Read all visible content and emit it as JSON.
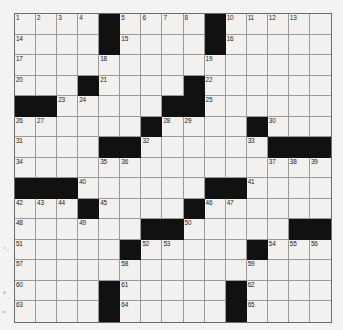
{
  "puzzle": {
    "title": "Crossword Grid",
    "rows": 15,
    "cols": 15,
    "colors": {
      "block": "#111111",
      "cell": "#f2f1ef",
      "gridline": "#9a9a9a",
      "border": "#6b6b6b",
      "page_background": "#f4f3f1",
      "number_text": "#1a1a1a"
    },
    "black_squares": [
      [
        0,
        4
      ],
      [
        0,
        9
      ],
      [
        1,
        4
      ],
      [
        1,
        9
      ],
      [
        3,
        3
      ],
      [
        3,
        8
      ],
      [
        4,
        0
      ],
      [
        4,
        1
      ],
      [
        4,
        7
      ],
      [
        4,
        8
      ],
      [
        5,
        6
      ],
      [
        5,
        11
      ],
      [
        6,
        4
      ],
      [
        6,
        5
      ],
      [
        6,
        12
      ],
      [
        6,
        13
      ],
      [
        6,
        14
      ],
      [
        8,
        0
      ],
      [
        8,
        1
      ],
      [
        8,
        2
      ],
      [
        8,
        9
      ],
      [
        8,
        10
      ],
      [
        9,
        3
      ],
      [
        9,
        8
      ],
      [
        10,
        6
      ],
      [
        10,
        7
      ],
      [
        10,
        13
      ],
      [
        10,
        14
      ],
      [
        11,
        5
      ],
      [
        11,
        11
      ],
      [
        13,
        4
      ],
      [
        13,
        10
      ],
      [
        14,
        4
      ],
      [
        14,
        10
      ]
    ],
    "numbers": [
      {
        "row": 0,
        "col": 0,
        "n": "1"
      },
      {
        "row": 0,
        "col": 1,
        "n": "2"
      },
      {
        "row": 0,
        "col": 2,
        "n": "3"
      },
      {
        "row": 0,
        "col": 3,
        "n": "4"
      },
      {
        "row": 0,
        "col": 5,
        "n": "5"
      },
      {
        "row": 0,
        "col": 6,
        "n": "6"
      },
      {
        "row": 0,
        "col": 7,
        "n": "7"
      },
      {
        "row": 0,
        "col": 8,
        "n": "8"
      },
      {
        "row": 0,
        "col": 9,
        "n": "9"
      },
      {
        "row": 0,
        "col": 10,
        "n": "10"
      },
      {
        "row": 0,
        "col": 11,
        "n": "11"
      },
      {
        "row": 0,
        "col": 12,
        "n": "12"
      },
      {
        "row": 0,
        "col": 13,
        "n": "13"
      },
      {
        "row": 1,
        "col": 0,
        "n": "14"
      },
      {
        "row": 1,
        "col": 5,
        "n": "15"
      },
      {
        "row": 1,
        "col": 10,
        "n": "16"
      },
      {
        "row": 2,
        "col": 0,
        "n": "17"
      },
      {
        "row": 2,
        "col": 4,
        "n": "18"
      },
      {
        "row": 2,
        "col": 9,
        "n": "19"
      },
      {
        "row": 3,
        "col": 0,
        "n": "20"
      },
      {
        "row": 3,
        "col": 4,
        "n": "21"
      },
      {
        "row": 3,
        "col": 9,
        "n": "22"
      },
      {
        "row": 4,
        "col": 2,
        "n": "23"
      },
      {
        "row": 4,
        "col": 3,
        "n": "24"
      },
      {
        "row": 4,
        "col": 9,
        "n": "25"
      },
      {
        "row": 5,
        "col": 0,
        "n": "26"
      },
      {
        "row": 5,
        "col": 1,
        "n": "27"
      },
      {
        "row": 5,
        "col": 7,
        "n": "28"
      },
      {
        "row": 5,
        "col": 8,
        "n": "29"
      },
      {
        "row": 5,
        "col": 12,
        "n": "30"
      },
      {
        "row": 6,
        "col": 0,
        "n": "31"
      },
      {
        "row": 6,
        "col": 6,
        "n": "32"
      },
      {
        "row": 6,
        "col": 11,
        "n": "33"
      },
      {
        "row": 7,
        "col": 0,
        "n": "34"
      },
      {
        "row": 7,
        "col": 4,
        "n": "35"
      },
      {
        "row": 7,
        "col": 5,
        "n": "36"
      },
      {
        "row": 7,
        "col": 12,
        "n": "37"
      },
      {
        "row": 7,
        "col": 13,
        "n": "38"
      },
      {
        "row": 7,
        "col": 14,
        "n": "39"
      },
      {
        "row": 8,
        "col": 3,
        "n": "40"
      },
      {
        "row": 8,
        "col": 11,
        "n": "41"
      },
      {
        "row": 9,
        "col": 0,
        "n": "42"
      },
      {
        "row": 9,
        "col": 1,
        "n": "43"
      },
      {
        "row": 9,
        "col": 2,
        "n": "44"
      },
      {
        "row": 9,
        "col": 4,
        "n": "45"
      },
      {
        "row": 9,
        "col": 9,
        "n": "46"
      },
      {
        "row": 9,
        "col": 10,
        "n": "47"
      },
      {
        "row": 10,
        "col": 0,
        "n": "48"
      },
      {
        "row": 10,
        "col": 3,
        "n": "49"
      },
      {
        "row": 10,
        "col": 8,
        "n": "50"
      },
      {
        "row": 11,
        "col": 0,
        "n": "51"
      },
      {
        "row": 11,
        "col": 6,
        "n": "52"
      },
      {
        "row": 11,
        "col": 7,
        "n": "53"
      },
      {
        "row": 11,
        "col": 12,
        "n": "54"
      },
      {
        "row": 11,
        "col": 13,
        "n": "55"
      },
      {
        "row": 11,
        "col": 14,
        "n": "56"
      },
      {
        "row": 12,
        "col": 0,
        "n": "57"
      },
      {
        "row": 12,
        "col": 5,
        "n": "58"
      },
      {
        "row": 12,
        "col": 11,
        "n": "59"
      },
      {
        "row": 13,
        "col": 0,
        "n": "60"
      },
      {
        "row": 13,
        "col": 5,
        "n": "61"
      },
      {
        "row": 13,
        "col": 11,
        "n": "62"
      },
      {
        "row": 14,
        "col": 0,
        "n": "63"
      },
      {
        "row": 14,
        "col": 5,
        "n": "64"
      },
      {
        "row": 14,
        "col": 11,
        "n": "65"
      }
    ],
    "entered_letters": []
  }
}
